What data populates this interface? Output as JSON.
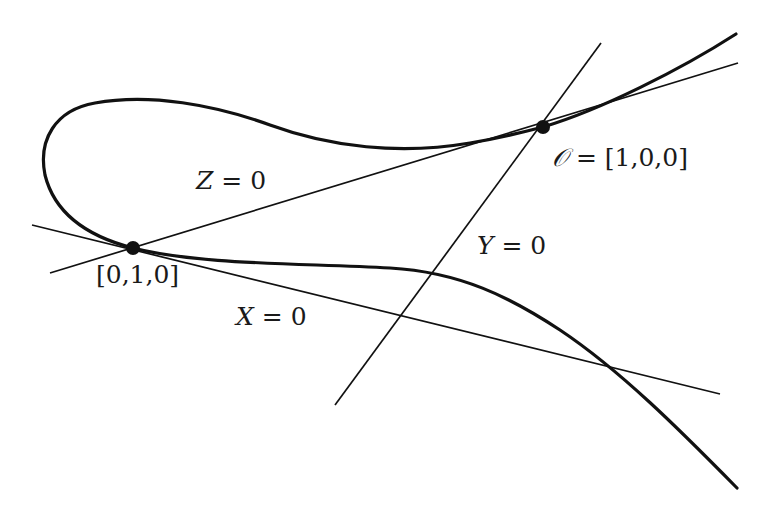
{
  "figure": {
    "colors": {
      "ink": "#111111",
      "background": "#ffffff"
    }
  },
  "points": [
    {
      "id": "O",
      "label_symbol": "𝒪",
      "label_rest": " = [1,0,0]",
      "x": 543,
      "y": 127
    },
    {
      "id": "P",
      "label": "[0,1,0]",
      "x": 133,
      "y": 248
    }
  ],
  "lines": [
    {
      "id": "Z0",
      "label_var": "Z",
      "label_rest": " = 0"
    },
    {
      "id": "X0",
      "label_var": "X",
      "label_rest": " = 0"
    },
    {
      "id": "Y0",
      "label_var": "Y",
      "label_rest": " = 0"
    }
  ]
}
